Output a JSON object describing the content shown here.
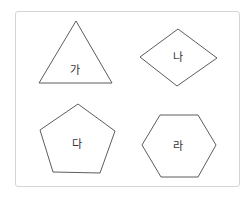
{
  "figure": {
    "shapes": [
      {
        "id": "ga",
        "label": "가",
        "type": "triangle"
      },
      {
        "id": "na",
        "label": "나",
        "type": "rhombus"
      },
      {
        "id": "da",
        "label": "다",
        "type": "pentagon"
      },
      {
        "id": "ra",
        "label": "라",
        "type": "hexagon"
      }
    ]
  },
  "colors": {
    "stroke": "#4a4a4a",
    "frame_border": "#d4d4d4",
    "text": "#333333",
    "background": "#ffffff"
  }
}
